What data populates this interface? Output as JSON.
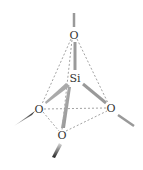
{
  "diagram": {
    "atoms": {
      "center": {
        "label": "Si",
        "x": 75,
        "y": 78
      },
      "top": {
        "label": "O",
        "x": 74,
        "y": 35
      },
      "left": {
        "label": "O",
        "x": 39,
        "y": 109
      },
      "right": {
        "label": "O",
        "x": 111,
        "y": 108
      },
      "front": {
        "label": "O",
        "x": 62,
        "y": 135
      }
    },
    "colors": {
      "bond": "#9a9a9a",
      "dashed_edge": "#8a8a8a",
      "wedge_dark": "#222222",
      "label": "#333333"
    }
  }
}
